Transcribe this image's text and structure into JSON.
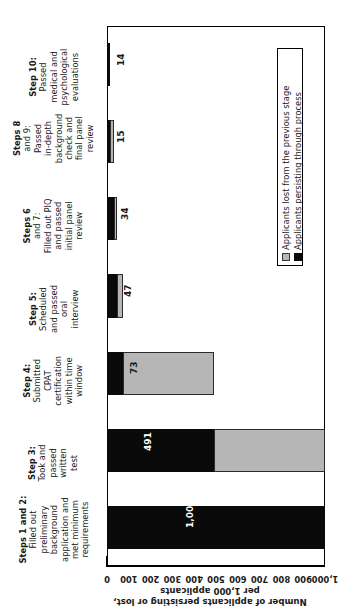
{
  "chart_data": {
    "type": "bar",
    "orientation": "horizontal-stacked",
    "title": "",
    "xlabel": "",
    "ylabel_line1": "Number of applicants persisting or lost,",
    "ylabel_line2": "per 1,000 applicants",
    "ylim": [
      0,
      1000
    ],
    "ytick_labels": [
      "0",
      "100",
      "200",
      "300",
      "400",
      "500",
      "600",
      "700",
      "800",
      "900",
      "1,000"
    ],
    "ytick_values": [
      0,
      100,
      200,
      300,
      400,
      500,
      600,
      700,
      800,
      900,
      1000
    ],
    "grid": false,
    "legend_position": "inside-upper-left",
    "legend": [
      {
        "label": "Applicants lost from the previous stage",
        "color": "#b6b6b6",
        "key": "lost"
      },
      {
        "label": "Applicants persisting through process",
        "color": "#0a0a0a",
        "key": "persist"
      }
    ],
    "categories": [
      "Steps 1 and 2: Filled out preliminary background application and met minimum requirements",
      "Step 3: Took and passed written test",
      "Step 4: Submitted CPAT certification within time window",
      "Step 5: Scheduled and passed oral interview",
      "Steps 6 and 7: Filled out PIQ and passed initial panel review",
      "Steps 8 and 9: Passed in-depth background check and final panel review",
      "Step 10: Passed medical and psychological evaluations"
    ],
    "series": [
      {
        "name": "Applicants persisting through process",
        "values": [
          1000,
          491,
          73,
          47,
          34,
          15,
          14
        ]
      },
      {
        "name": "Applicants lost from the previous stage",
        "values": [
          0,
          509,
          418,
          26,
          13,
          19,
          1
        ]
      }
    ],
    "data_labels": [
      "1,000",
      "491",
      "73",
      "47",
      "34",
      "15",
      "14"
    ]
  },
  "categories_display": [
    {
      "head": "Steps 1 and 2:",
      "lines": [
        "Filled out",
        "preliminary",
        "background",
        "application and",
        "met minimum",
        "requirements"
      ]
    },
    {
      "head": "Step 3:",
      "lines": [
        "Took and",
        "passed",
        "written",
        "test"
      ]
    },
    {
      "head": "Step 4:",
      "lines": [
        "Submitted",
        "CPAT",
        "certification",
        "within time",
        "window"
      ]
    },
    {
      "head": "Step 5:",
      "lines": [
        "Scheduled",
        "and passed",
        "oral",
        "interview"
      ]
    },
    {
      "head": "Steps 6",
      "lines": [
        "and 7:",
        "Filled out PIQ",
        "and passed",
        "initial panel",
        "review"
      ]
    },
    {
      "head": "Steps 8",
      "lines": [
        "and 9:",
        "Passed",
        "in-depth",
        "background",
        "check and",
        "final panel",
        "review"
      ]
    },
    {
      "head": "Step 10:",
      "lines": [
        "Passed",
        "medical and",
        "psychological",
        "evaluations"
      ]
    }
  ]
}
